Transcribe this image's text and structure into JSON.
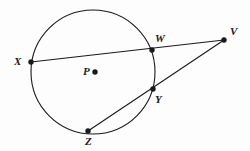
{
  "figure": {
    "type": "circle-geometry-diagram",
    "canvas": {
      "width": 250,
      "height": 151
    },
    "background_color": "#fdfdfd",
    "stroke_color": "#1a1a1a",
    "circle": {
      "name": "circle-P",
      "center_label": "P",
      "cx": 93,
      "cy": 72,
      "r": 62,
      "stroke_width": 1
    },
    "points": [
      {
        "id": "X",
        "label": "X",
        "x": 31,
        "y": 62,
        "label_x": 14,
        "label_y": 56,
        "on_circle": true,
        "dot": true
      },
      {
        "id": "P",
        "label": "P",
        "x": 95,
        "y": 72,
        "label_x": 83,
        "label_y": 66,
        "on_circle": false,
        "dot": true
      },
      {
        "id": "W",
        "label": "W",
        "x": 152,
        "y": 50,
        "label_x": 155,
        "label_y": 33,
        "on_circle": true,
        "dot": true
      },
      {
        "id": "V",
        "label": "V",
        "x": 224,
        "y": 40,
        "label_x": 230,
        "label_y": 26,
        "on_circle": false,
        "dot": true
      },
      {
        "id": "Y",
        "label": "Y",
        "x": 153,
        "y": 89,
        "label_x": 155,
        "label_y": 94,
        "on_circle": true,
        "dot": true
      },
      {
        "id": "Z",
        "label": "Z",
        "x": 88,
        "y": 131,
        "label_x": 85,
        "label_y": 136,
        "on_circle": true,
        "dot": true
      }
    ],
    "segments": [
      {
        "id": "XV",
        "name": "secant-x-w-v",
        "from": "X",
        "to": "V",
        "x1": 31,
        "y1": 62,
        "x2": 224,
        "y2": 40
      },
      {
        "id": "ZV",
        "name": "secant-z-y-v",
        "from": "Z",
        "to": "V",
        "x1": 88,
        "y1": 131,
        "x2": 224,
        "y2": 40
      }
    ],
    "dot_radius": 2.6
  }
}
